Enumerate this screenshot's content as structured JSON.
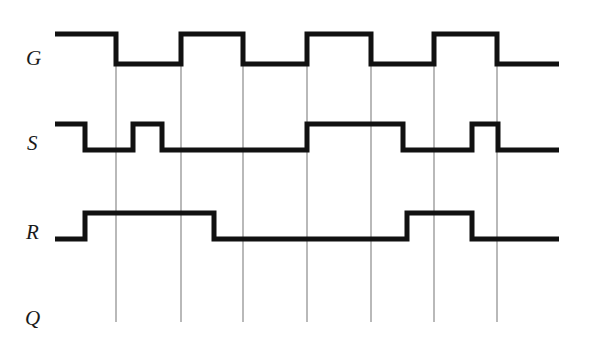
{
  "figure": {
    "type": "digital-timing-diagram",
    "title": "",
    "background_color": "#ffffff",
    "width": 589,
    "height": 348
  },
  "style": {
    "waveform_color": "#111111",
    "waveform_stroke_width": 5,
    "gridline_color": "#8a8a8a",
    "gridline_stroke_width": 1.2,
    "label_color": "#1a1a1a"
  },
  "axis": {
    "x_start": 55,
    "x_end": 559,
    "gridlines_x": [
      116,
      181,
      243,
      307,
      371,
      434,
      497
    ],
    "gridline_y_top": 65,
    "gridline_y_bottom": 322
  },
  "signals": [
    {
      "name": "G",
      "label": "G",
      "label_x": 26,
      "label_y": 48,
      "level_high_y": 34,
      "level_low_y": 64,
      "initial_level": "high",
      "transitions_x": [
        116,
        181,
        243,
        307,
        371,
        434,
        497
      ],
      "segments": [
        {
          "from": 55,
          "to": 116,
          "level": "high"
        },
        {
          "from": 116,
          "to": 181,
          "level": "low"
        },
        {
          "from": 181,
          "to": 243,
          "level": "high"
        },
        {
          "from": 243,
          "to": 307,
          "level": "low"
        },
        {
          "from": 307,
          "to": 371,
          "level": "high"
        },
        {
          "from": 371,
          "to": 434,
          "level": "low"
        },
        {
          "from": 434,
          "to": 497,
          "level": "high"
        },
        {
          "from": 497,
          "to": 559,
          "level": "low"
        }
      ]
    },
    {
      "name": "S",
      "label": "S",
      "label_x": 27,
      "label_y": 133,
      "level_high_y": 124,
      "level_low_y": 150,
      "initial_level": "high",
      "transitions_x": [
        85,
        133,
        162,
        307,
        403,
        472,
        498
      ],
      "segments": [
        {
          "from": 55,
          "to": 85,
          "level": "high"
        },
        {
          "from": 85,
          "to": 133,
          "level": "low"
        },
        {
          "from": 133,
          "to": 162,
          "level": "high"
        },
        {
          "from": 162,
          "to": 307,
          "level": "low"
        },
        {
          "from": 307,
          "to": 403,
          "level": "high"
        },
        {
          "from": 403,
          "to": 472,
          "level": "low"
        },
        {
          "from": 472,
          "to": 498,
          "level": "high"
        },
        {
          "from": 498,
          "to": 559,
          "level": "low"
        }
      ]
    },
    {
      "name": "R",
      "label": "R",
      "label_x": 26,
      "label_y": 222,
      "level_high_y": 213,
      "level_low_y": 239,
      "initial_level": "low",
      "transitions_x": [
        85,
        214,
        407,
        472
      ],
      "segments": [
        {
          "from": 55,
          "to": 85,
          "level": "low"
        },
        {
          "from": 85,
          "to": 214,
          "level": "high"
        },
        {
          "from": 214,
          "to": 407,
          "level": "low"
        },
        {
          "from": 407,
          "to": 472,
          "level": "high"
        },
        {
          "from": 472,
          "to": 559,
          "level": "low"
        }
      ]
    },
    {
      "name": "Q",
      "label": "Q",
      "label_x": 25,
      "label_y": 308,
      "level_high_y": null,
      "level_low_y": null,
      "initial_level": null,
      "transitions_x": [],
      "segments": []
    }
  ]
}
